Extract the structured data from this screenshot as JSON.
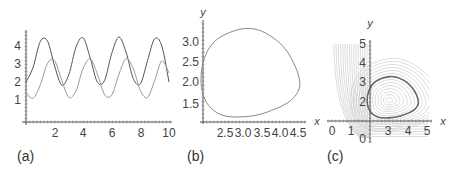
{
  "chart_data": [
    {
      "panel": "(a)",
      "type": "line",
      "title": "",
      "xlabel": "",
      "ylabel": "",
      "xlim": [
        0,
        10
      ],
      "ylim": [
        0,
        4.6
      ],
      "x_ticks": [
        "2",
        "4",
        "6",
        "8",
        "10"
      ],
      "y_ticks": [
        "1",
        "2",
        "3",
        "4"
      ],
      "grid": false,
      "x": [
        0,
        0.5,
        1,
        1.5,
        2,
        2.5,
        3,
        3.5,
        4,
        4.5,
        5,
        5.5,
        6,
        6.5,
        7,
        7.5,
        8,
        8.5,
        9,
        9.5,
        10
      ],
      "series": [
        {
          "name": "x(t)",
          "color": "#555555",
          "values": [
            2.0,
            2.82,
            4.25,
            4.28,
            2.89,
            1.82,
            2.43,
            3.95,
            4.45,
            3.3,
            1.98,
            2.1,
            3.6,
            4.5,
            3.65,
            2.19,
            1.9,
            3.2,
            4.4,
            4.0,
            2.0
          ]
        },
        {
          "name": "y(t)",
          "color": "#999999",
          "values": [
            1.4,
            1.1,
            1.84,
            3.03,
            3.18,
            2.09,
            1.14,
            1.53,
            2.77,
            3.29,
            2.42,
            1.29,
            1.29,
            2.44,
            3.29,
            2.75,
            1.52,
            1.14,
            2.09,
            3.17,
            2.5
          ]
        }
      ]
    },
    {
      "panel": "(b)",
      "type": "line",
      "title": "",
      "xlabel": "x",
      "ylabel": "y",
      "xlim": [
        1.9,
        4.6
      ],
      "ylim": [
        1.05,
        3.4
      ],
      "x_ticks": [
        "2.5",
        "3.0",
        "3.5",
        "4.0",
        "4.5"
      ],
      "y_ticks": [
        "1.5",
        "2.0",
        "2.5",
        "3.0"
      ],
      "grid": false,
      "series": [
        {
          "name": "limit cycle",
          "color": "#888888",
          "points": [
            [
              1.85,
              2.0
            ],
            [
              1.95,
              2.6
            ],
            [
              2.3,
              3.05
            ],
            [
              3.0,
              3.3
            ],
            [
              3.6,
              3.2
            ],
            [
              4.2,
              2.75
            ],
            [
              4.55,
              2.0
            ],
            [
              4.3,
              1.55
            ],
            [
              3.6,
              1.25
            ],
            [
              3.0,
              1.15
            ],
            [
              2.4,
              1.2
            ],
            [
              2.0,
              1.5
            ],
            [
              1.85,
              2.0
            ]
          ]
        }
      ]
    },
    {
      "panel": "(c)",
      "type": "line",
      "title": "",
      "xlabel": "x",
      "ylabel": "y",
      "xlim": [
        0,
        5
      ],
      "ylim": [
        0,
        5
      ],
      "x_ticks": [
        "0",
        "1",
        "3",
        "4",
        "5"
      ],
      "y_ticks": [
        "0",
        "2",
        "3",
        "4",
        "5"
      ],
      "grid": false,
      "description": "phase portrait: stream lines with highlighted limit cycle around center (3,2)",
      "series": [
        {
          "name": "limit cycle",
          "color": "#666666",
          "points": [
            [
              1.85,
              2.0
            ],
            [
              1.95,
              2.6
            ],
            [
              2.3,
              3.05
            ],
            [
              3.0,
              3.3
            ],
            [
              3.6,
              3.2
            ],
            [
              4.2,
              2.75
            ],
            [
              4.55,
              2.0
            ],
            [
              4.3,
              1.55
            ],
            [
              3.6,
              1.25
            ],
            [
              3.0,
              1.15
            ],
            [
              2.4,
              1.2
            ],
            [
              2.0,
              1.5
            ],
            [
              1.85,
              2.0
            ]
          ]
        }
      ]
    }
  ],
  "labels": {
    "panel_a": "(a)",
    "panel_b": "(b)",
    "panel_c": "(c)",
    "b_y": "y",
    "c_y": "y",
    "c_x_left": "x",
    "c_x_right": "x",
    "a_x_ticks": [
      "2",
      "4",
      "6",
      "8",
      "10"
    ],
    "a_y_ticks": [
      "1",
      "2",
      "3",
      "4"
    ],
    "b_x_ticks": [
      "2.5",
      "3.0",
      "3.5",
      "4.0",
      "4.5"
    ],
    "b_y_ticks": [
      "1.5",
      "2.0",
      "2.5",
      "3.0"
    ],
    "c_x_ticks": [
      "0",
      "1",
      "3",
      "4",
      "5"
    ],
    "c_y_ticks": [
      "0",
      "2",
      "3",
      "4",
      "5"
    ]
  }
}
